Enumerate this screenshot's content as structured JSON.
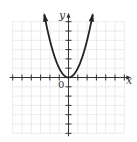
{
  "chart_data": {
    "type": "line",
    "title": "",
    "function": "y = x^2",
    "xlabel": "x",
    "ylabel": "y",
    "origin_label": "0",
    "xlim": [
      -6,
      6
    ],
    "ylim": [
      -6,
      6
    ],
    "grid": true,
    "tick_spacing": 1,
    "series": [
      {
        "name": "y = x^2",
        "x": [
          -2.6,
          -2,
          -1.5,
          -1,
          -0.5,
          0,
          0.5,
          1,
          1.5,
          2,
          2.6
        ],
        "y": [
          5.76,
          4,
          2.25,
          1,
          0.25,
          0,
          0.25,
          1,
          2.25,
          4,
          5.76
        ],
        "arrows_at_ends": true
      }
    ],
    "colors": {
      "grid": "#e6e6e6",
      "axis": "#333333",
      "curve": "#222222"
    }
  }
}
